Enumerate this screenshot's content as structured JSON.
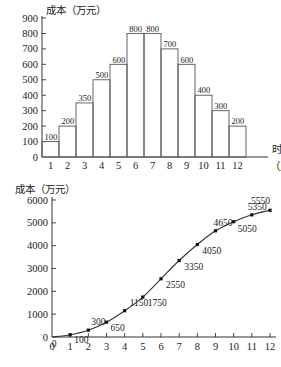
{
  "figure": {
    "kind": "two-panel-statistics-figure",
    "language": "zh-CN"
  },
  "chart_data": [
    {
      "type": "bar",
      "panel": "top",
      "title": "成本（万元）",
      "xlabel": "时间",
      "xlabel_unit": "（月）",
      "ylabel": "成本（万元）",
      "categories": [
        "1",
        "2",
        "3",
        "4",
        "5",
        "6",
        "7",
        "8",
        "9",
        "10",
        "11",
        "12"
      ],
      "values": [
        100,
        200,
        350,
        500,
        600,
        800,
        800,
        700,
        600,
        400,
        300,
        200
      ],
      "data_labels": [
        "100",
        "200",
        "350",
        "500",
        "600",
        "800",
        "800",
        "700",
        "600",
        "400",
        "300",
        "200"
      ],
      "yticks": [
        "0",
        "100",
        "200",
        "300",
        "400",
        "500",
        "600",
        "700",
        "800",
        "900"
      ],
      "ytick_values": [
        0,
        100,
        200,
        300,
        400,
        500,
        600,
        700,
        800,
        900
      ],
      "ylim": [
        0,
        900
      ],
      "grid": false,
      "legend": "none"
    },
    {
      "type": "line",
      "panel": "bottom",
      "title": "成本（万元）",
      "xlabel": "",
      "ylabel": "成本（万元）",
      "x": [
        0,
        1,
        2,
        3,
        4,
        5,
        6,
        7,
        8,
        9,
        10,
        11,
        12
      ],
      "values": [
        0,
        100,
        300,
        650,
        1150,
        1750,
        2550,
        3350,
        4050,
        4650,
        5050,
        5350,
        5550
      ],
      "data_labels": [
        "0",
        "100",
        "300",
        "650",
        "1150",
        "1750",
        "2550",
        "3350",
        "4050",
        "4650",
        "5050",
        "5350",
        "5550"
      ],
      "xticks": [
        "0",
        "1",
        "2",
        "3",
        "4",
        "5",
        "6",
        "7",
        "8",
        "9",
        "10",
        "11",
        "12"
      ],
      "yticks": [
        "0",
        "1000",
        "2000",
        "3000",
        "4000",
        "5000",
        "6000"
      ],
      "ytick_values": [
        0,
        1000,
        2000,
        3000,
        4000,
        5000,
        6000
      ],
      "ylim": [
        0,
        6000
      ],
      "xlim": [
        0,
        12
      ],
      "grid": false,
      "legend": "none",
      "markers": "filled-square"
    }
  ]
}
